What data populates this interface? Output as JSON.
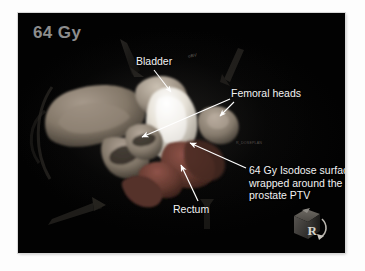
{
  "viewport": {
    "dose_label": "64 Gy",
    "background_color": "#020202"
  },
  "annotations": [
    {
      "id": "bladder",
      "text": "Bladder"
    },
    {
      "id": "femoral",
      "text": "Femoral heads"
    },
    {
      "id": "rectum",
      "text": "Rectum"
    },
    {
      "id": "isodose",
      "text": "64 Gy Isodose surface wrapped around the prostate PTV"
    }
  ],
  "scene_tags": {
    "bladder_superscript": "oBV",
    "mid_right": "R_DOSEPLAN"
  },
  "orientation_cube": {
    "face_letter": "R",
    "name": "orientation-cube"
  },
  "structures": {
    "pelvic_bone_color": "#8d8176",
    "isodose_surface_color": "#f0ece4",
    "rectum_color": "#7a4840",
    "femoral_head_color": "#9a8d80",
    "bladder_color": "#b8ada0"
  },
  "leader_color": "#ffffff"
}
